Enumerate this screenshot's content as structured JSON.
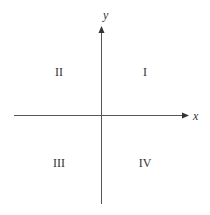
{
  "diagram": {
    "axes": {
      "x_label": "x",
      "y_label": "y"
    },
    "quadrants": [
      {
        "id": "I",
        "label": "I"
      },
      {
        "id": "II",
        "label": "II"
      },
      {
        "id": "III",
        "label": "III"
      },
      {
        "id": "IV",
        "label": "IV"
      }
    ],
    "colors": {
      "axis": "#444444",
      "text": "#333333",
      "background": "#ffffff"
    }
  }
}
